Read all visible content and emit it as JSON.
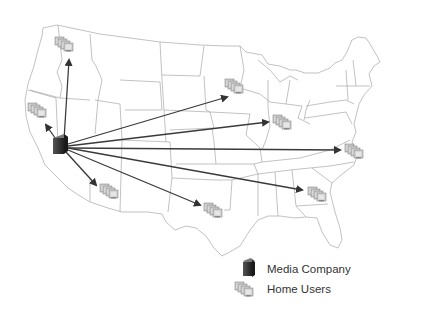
{
  "diagram": {
    "type": "network-distribution-map",
    "background": "map of contiguous United States with state borders",
    "source_node": {
      "label": "Media Company",
      "icon": "server-tower-icon",
      "x": 60,
      "y": 148
    },
    "targets": [
      {
        "region": "Washington",
        "x": 65,
        "y": 45
      },
      {
        "region": "Northern California",
        "x": 40,
        "y": 112
      },
      {
        "region": "Arizona",
        "x": 112,
        "y": 192
      },
      {
        "region": "Texas",
        "x": 216,
        "y": 212
      },
      {
        "region": "Minnesota",
        "x": 237,
        "y": 88
      },
      {
        "region": "Illinois",
        "x": 287,
        "y": 124
      },
      {
        "region": "Virginia",
        "x": 357,
        "y": 152
      },
      {
        "region": "Georgia",
        "x": 320,
        "y": 195
      }
    ],
    "colors": {
      "arrow": "#3a3a3a",
      "border": "#9a9a9a",
      "server": "#2e2e2e",
      "client": "#b8b8b8"
    }
  },
  "legend": {
    "items": [
      {
        "label": "Media Company",
        "icon": "server-tower-icon"
      },
      {
        "label": "Home Users",
        "icon": "computer-cluster-icon"
      }
    ]
  }
}
